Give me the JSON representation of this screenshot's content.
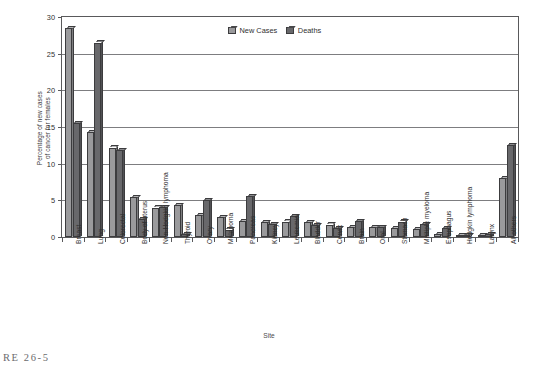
{
  "chart_data": {
    "type": "bar",
    "title": "",
    "xlabel": "Site",
    "ylabel": "Percentage of new cases\nof cancer for females",
    "ylim": [
      0,
      30
    ],
    "yticks": [
      0,
      5,
      10,
      15,
      20,
      25,
      30
    ],
    "ytick_labels": [
      "0",
      "5",
      "10",
      "15",
      "20",
      "25",
      "30"
    ],
    "grid": true,
    "legend_position": "top-center",
    "categories": [
      "Breast",
      "Lung",
      "Colorectal",
      "Body of uterus",
      "Non-Hodgkin lymphoma",
      "Thyroid",
      "Ovary",
      "Melanoma",
      "Pancreas",
      "Kidney",
      "Leukemia",
      "Bladder",
      "Cervix",
      "Brain",
      "Oral",
      "Stomach",
      "Multiple myeloma",
      "Esophagus",
      "Hodgkin lymphoma",
      "Larynx",
      "All others"
    ],
    "series": [
      {
        "name": "New Cases",
        "color": "#9a9a9c",
        "values": [
          28.5,
          14.3,
          12.2,
          5.4,
          4.0,
          4.4,
          3.0,
          2.7,
          2.2,
          2.0,
          2.1,
          2.0,
          1.7,
          1.3,
          1.3,
          1.2,
          1.1,
          0.4,
          0.3,
          0.3,
          8.0
        ]
      },
      {
        "name": "Deaths",
        "color": "#68686b",
        "values": [
          15.5,
          26.5,
          11.8,
          2.4,
          4.1,
          0.4,
          5.0,
          1.0,
          5.6,
          1.8,
          2.9,
          1.6,
          1.2,
          2.2,
          1.3,
          2.1,
          1.8,
          1.2,
          0.2,
          0.4,
          12.5
        ]
      }
    ]
  },
  "legend": {
    "items": [
      {
        "label": "New Cases",
        "color": "#9a9a9c"
      },
      {
        "label": "Deaths",
        "color": "#68686b"
      }
    ]
  },
  "axes": {
    "y_title": "Percentage of new cases\nof cancer for females",
    "x_title": "Site"
  },
  "caption": {
    "text": "RE 26-5"
  }
}
